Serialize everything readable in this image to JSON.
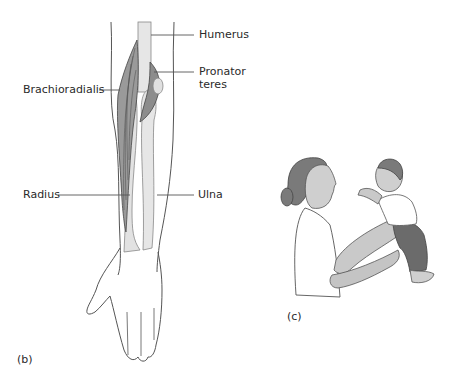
{
  "figure_b": {
    "panel_label": "(b)",
    "labels": {
      "humerus": "Humerus",
      "pronator_teres_line1": "Pronator",
      "pronator_teres_line2": "teres",
      "brachioradialis": "Brachioradialis",
      "radius": "Radius",
      "ulna": "Ulna"
    }
  },
  "figure_c": {
    "panel_label": "(c)"
  },
  "colors": {
    "line": "#555555",
    "bone": "#e6e6e6",
    "muscle": "#8c8c8c",
    "skin": "#cfcfcf",
    "hair": "#7a7a7a",
    "trousers": "#6b6b6b"
  }
}
